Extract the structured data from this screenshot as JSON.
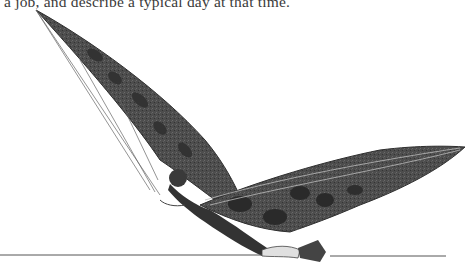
{
  "page": {
    "text_line": "a job, and describe a typical day at that time.",
    "illustration": {
      "subject": "person-on-bat-wing-glider",
      "wing_color": "#4a4a4a",
      "spot_color": "#2a2a2a",
      "line_color": "#555555"
    }
  }
}
